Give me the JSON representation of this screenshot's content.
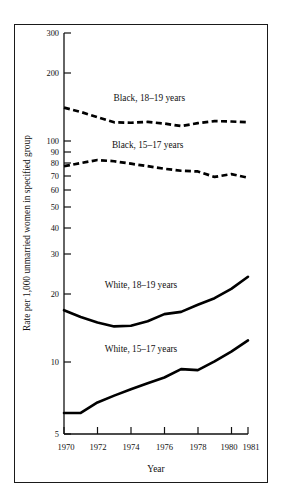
{
  "chart_data": {
    "type": "line",
    "title": "",
    "xlabel": "Year",
    "ylabel": "Rate per 1,000 unmarried women in specified group",
    "yscale": "log",
    "ylim": [
      5,
      300
    ],
    "xlim": [
      1970,
      1981
    ],
    "grid": false,
    "legend_position": "inline-annotations",
    "ytick_labels": [
      "300",
      "200",
      "100",
      "90",
      "80",
      "70",
      "60",
      "50",
      "40",
      "30",
      "20",
      "10",
      "5"
    ],
    "ytick_values": [
      300,
      200,
      100,
      90,
      80,
      70,
      60,
      50,
      40,
      30,
      20,
      10,
      5
    ],
    "xtick_labels": [
      "1970",
      "1972",
      "1974",
      "1976",
      "1978",
      "1980",
      "1981"
    ],
    "xtick_values": [
      1970,
      1972,
      1974,
      1976,
      1978,
      1980,
      1981
    ],
    "x": [
      1970,
      1971,
      1972,
      1973,
      1974,
      1975,
      1976,
      1977,
      1978,
      1979,
      1980,
      1981
    ],
    "series": [
      {
        "name": "Black, 18–19 years",
        "style": "dashed",
        "label_x": 1975.1,
        "label_y": 150,
        "values": [
          140.0,
          134.0,
          127.0,
          120.5,
          120.0,
          121.0,
          119.0,
          116.0,
          119.5,
          122.0,
          121.5,
          120.5
        ]
      },
      {
        "name": "Black, 15–17 years",
        "style": "dashed",
        "label_x": 1975.0,
        "label_y": 93,
        "values": [
          77.0,
          79.5,
          82.0,
          81.0,
          79.0,
          77.0,
          75.0,
          73.5,
          73.0,
          69.0,
          71.0,
          68.5
        ]
      },
      {
        "name": "White, 18–19 years",
        "style": "solid",
        "label_x": 1974.6,
        "label_y": 22.2,
        "values": [
          17.7,
          16.5,
          15.6,
          15.0,
          15.1,
          15.8,
          17.0,
          17.4,
          18.7,
          20.0,
          22.0,
          24.9
        ]
      },
      {
        "name": "White, 15–17 years",
        "style": "solid",
        "label_x": 1974.6,
        "label_y": 11.6,
        "values": [
          6.2,
          6.2,
          6.9,
          7.4,
          7.9,
          8.4,
          8.9,
          9.7,
          9.6,
          10.5,
          11.6,
          13.0
        ]
      }
    ]
  }
}
